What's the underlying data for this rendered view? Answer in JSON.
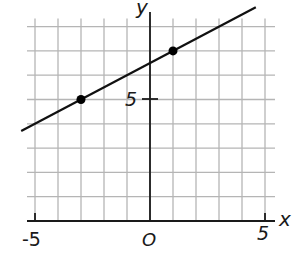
{
  "chart_data": {
    "type": "line",
    "title": "",
    "xlabel": "x",
    "ylabel": "y",
    "xlim": [
      -5,
      5
    ],
    "ylim": [
      0,
      8
    ],
    "grid": true,
    "x_tick_labels": [
      "-5",
      "O",
      "5"
    ],
    "y_tick_labels": [
      "5"
    ],
    "series": [
      {
        "name": "line",
        "slope": 0.5,
        "intercept": 6.5,
        "x": [
          -5.6,
          4.6
        ],
        "y": [
          3.7,
          8.8
        ]
      }
    ],
    "points": [
      {
        "x": -3,
        "y": 5
      },
      {
        "x": 1,
        "y": 7
      }
    ],
    "legend": null
  },
  "labels": {
    "x_axis": "x",
    "y_axis": "y",
    "x_min": "-5",
    "origin": "O",
    "x_max": "5",
    "y_five": "5"
  }
}
